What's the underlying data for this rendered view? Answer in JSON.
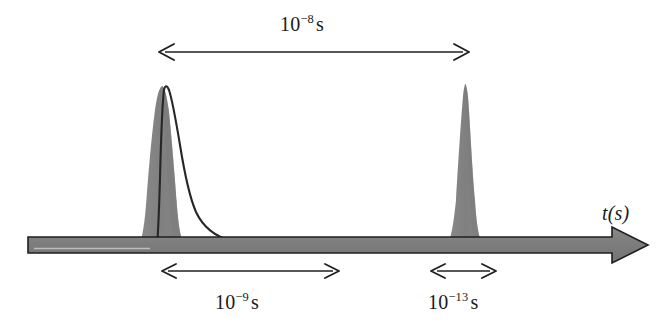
{
  "figure": {
    "type": "timeline-diagram",
    "width": 664,
    "height": 331,
    "background": "#ffffff"
  },
  "axis": {
    "label_mantissa": "t(s)",
    "label_name": "time-axis-label",
    "direction": "left-to-right",
    "start_x": 28,
    "end_x": 648,
    "y": 245,
    "color": "#808080",
    "outline_color": "#1a1a1a"
  },
  "peaks": [
    {
      "name": "first-pulse",
      "center_x": 162,
      "apex_y": 86,
      "shape": "asymmetric-sharp-rise-exponential-decay",
      "fill": "#808080",
      "stroke": "#1a1a1a",
      "has_decay_tail": true,
      "tail_end_x": 300
    },
    {
      "name": "second-pulse",
      "center_x": 465,
      "apex_y": 84,
      "shape": "narrow-symmetric",
      "fill": "#808080",
      "stroke": "#808080",
      "has_decay_tail": false,
      "tail_end_x": null
    }
  ],
  "annotations": [
    {
      "name": "interval-separation",
      "position": "top",
      "mantissa": "10",
      "exponent": "−8",
      "unit": "s",
      "arrow_start_x": 160,
      "arrow_end_x": 468,
      "arrow_y": 52,
      "label_x": 280,
      "label_y": 14,
      "arrow_style": "double-headed"
    },
    {
      "name": "interval-decay-time",
      "position": "bottom-left",
      "mantissa": "10",
      "exponent": "−9",
      "unit": "s",
      "arrow_start_x": 163,
      "arrow_end_x": 338,
      "arrow_y": 271,
      "label_x": 215,
      "label_y": 292,
      "arrow_style": "double-headed"
    },
    {
      "name": "interval-pulse-width",
      "position": "bottom-right",
      "mantissa": "10",
      "exponent": "−13",
      "unit": "s",
      "arrow_start_x": 432,
      "arrow_end_x": 495,
      "arrow_y": 271,
      "label_x": 428,
      "label_y": 292,
      "arrow_style": "double-headed"
    }
  ],
  "colors": {
    "fill_gray": "#808080",
    "ink_black": "#1a1a1a",
    "page_white": "#ffffff"
  }
}
